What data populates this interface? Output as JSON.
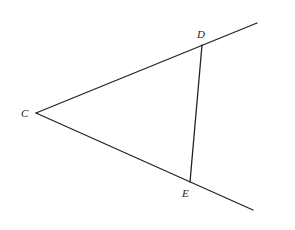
{
  "diagram": {
    "type": "geometry",
    "stroke_color": "#222222",
    "background": "#ffffff",
    "points": {
      "C": {
        "label": "C",
        "x": 36,
        "y": 113
      },
      "D": {
        "label": "D",
        "x": 202,
        "y": 45
      },
      "E": {
        "label": "E",
        "x": 190,
        "y": 182
      }
    },
    "rays": [
      {
        "name": "ray-CD",
        "from": "C",
        "through": "D",
        "end": {
          "x": 257,
          "y": 23
        }
      },
      {
        "name": "ray-CE",
        "from": "C",
        "through": "E",
        "end": {
          "x": 253,
          "y": 210
        }
      }
    ],
    "segments": [
      {
        "name": "segment-DE",
        "from": "D",
        "to": "E"
      }
    ]
  }
}
